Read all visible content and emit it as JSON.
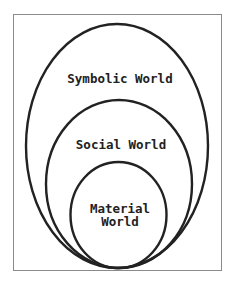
{
  "diagram": {
    "type": "nested-ellipses",
    "colors": {
      "stroke": "#222222",
      "frame": "#8a8a8a",
      "background": "#ffffff",
      "text": "#222222"
    },
    "layers": [
      {
        "id": "symbolic",
        "label": "Symbolic World"
      },
      {
        "id": "social",
        "label": "Social World"
      },
      {
        "id": "material",
        "label_line1": "Material",
        "label_line2": "World"
      }
    ]
  }
}
